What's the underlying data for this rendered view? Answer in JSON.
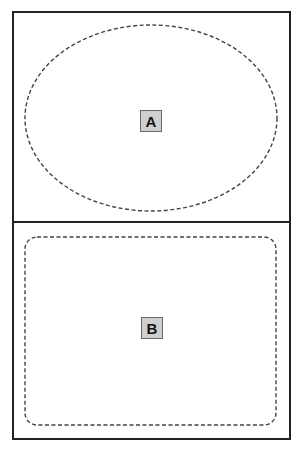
{
  "diagram": {
    "frame": {
      "x": 13,
      "y": 12,
      "width": 277,
      "height": 427,
      "stroke": "#222222",
      "stroke_width": 2
    },
    "divider_y": 222,
    "panels": [
      {
        "id": "top",
        "shape": "ellipse",
        "dashed": true,
        "cx": 151,
        "cy": 118,
        "rx": 126,
        "ry": 93,
        "label": "A"
      },
      {
        "id": "bottom",
        "shape": "rounded-rectangle",
        "dashed": true,
        "x": 25,
        "y": 237,
        "width": 251,
        "height": 188,
        "corner_radius": 12,
        "label": "B"
      }
    ],
    "colors": {
      "line": "#222222",
      "dash": "#444444",
      "label_fill": "#cfcfcf",
      "label_border": "#6a6a6a",
      "label_text": "#111111"
    }
  }
}
